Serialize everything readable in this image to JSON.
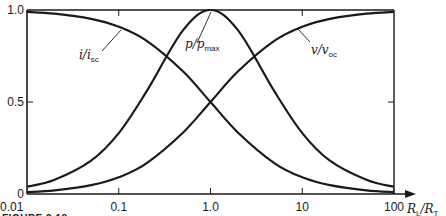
{
  "chart_data": {
    "type": "line",
    "title": "",
    "xlabel": "R_L/R_T",
    "ylabel": "",
    "x_scale": "log",
    "xlim": [
      0.01,
      100
    ],
    "ylim": [
      0,
      1.0
    ],
    "grid": false,
    "legend": "inline annotations",
    "x_ticks": [
      0.01,
      0.1,
      1.0,
      10,
      100
    ],
    "x_tick_labels": [
      "0.01",
      "0.1",
      "1.0",
      "10",
      "100"
    ],
    "y_ticks": [
      0,
      0.5,
      1.0
    ],
    "y_tick_labels": [
      "0",
      "0.5",
      "1.0"
    ],
    "x": [
      0.01,
      0.02,
      0.05,
      0.1,
      0.2,
      0.5,
      1.0,
      2,
      5,
      10,
      20,
      50,
      100
    ],
    "series": [
      {
        "name": "i/i_sc",
        "label_main": "i/i",
        "label_sub": "sc",
        "values": [
          0.99,
          0.98,
          0.952,
          0.909,
          0.833,
          0.667,
          0.5,
          0.333,
          0.167,
          0.091,
          0.048,
          0.02,
          0.01
        ]
      },
      {
        "name": "p/p_max",
        "label_main": "p/p",
        "label_sub": "max",
        "values": [
          0.039,
          0.077,
          0.181,
          0.331,
          0.556,
          0.889,
          1.0,
          0.889,
          0.556,
          0.331,
          0.181,
          0.077,
          0.039
        ]
      },
      {
        "name": "v/v_oc",
        "label_main": "v/v",
        "label_sub": "oc",
        "values": [
          0.01,
          0.02,
          0.048,
          0.091,
          0.167,
          0.333,
          0.5,
          0.667,
          0.833,
          0.909,
          0.952,
          0.98,
          0.99
        ]
      }
    ],
    "annotations": [
      {
        "text": "i/i_sc",
        "points_to_x": 0.4
      },
      {
        "text": "p/p_max",
        "points_to_x": 1.0
      },
      {
        "text": "v/v_oc",
        "points_to_x": 7
      }
    ],
    "caption": "FIGURE 2.18"
  },
  "axis": {
    "x_title_main": "R",
    "x_title_sub1": "L",
    "x_title_slash": "/R",
    "x_title_sub2": "T"
  }
}
